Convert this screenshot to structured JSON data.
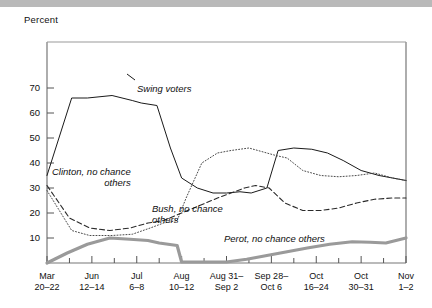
{
  "figure": {
    "top_rule": true,
    "y_axis_title": "Percent"
  },
  "chart_data": {
    "type": "line",
    "title": "",
    "subtitle": "",
    "xlabel": "",
    "ylabel": "Percent",
    "ylim": [
      0,
      78
    ],
    "yticks": [
      10,
      20,
      30,
      40,
      50,
      60,
      70
    ],
    "grid": false,
    "legend": "inline-annotations",
    "x": [
      "Mar 20–22",
      "Jun 12–14",
      "Jul 6–8",
      "Aug 10–12",
      "Aug 31–Sep 2",
      "Sep 28–Oct 6",
      "Oct 16–24",
      "Oct 30–31",
      "Nov 1–2"
    ],
    "x_tick_labels": [
      {
        "line1": "Mar",
        "line2": "20–22"
      },
      {
        "line1": "Jun",
        "line2": "12–14"
      },
      {
        "line1": "Jul",
        "line2": "6–8"
      },
      {
        "line1": "Aug",
        "line2": "10–12"
      },
      {
        "line1": "Aug 31–",
        "line2": "Sep 2"
      },
      {
        "line1": "Sep 28–",
        "line2": "Oct 6"
      },
      {
        "line1": "Oct",
        "line2": "16–24"
      },
      {
        "line1": "Oct",
        "line2": "30–31"
      },
      {
        "line1": "Nov",
        "line2": "1–2"
      }
    ],
    "series": [
      {
        "name": "Swing voters",
        "style": "solid",
        "color": "#1a1a1a",
        "width": 1,
        "label_text": "Swing voters",
        "x": [
          0,
          0.55,
          0.9,
          1.45,
          1.9,
          2.1,
          2.45,
          2.75,
          3.0,
          3.35,
          3.7,
          4.0,
          4.3,
          4.55,
          4.9,
          5.15,
          5.5,
          5.9,
          6.25,
          6.6,
          7.0,
          7.4,
          8.0
        ],
        "values": [
          35,
          66,
          66,
          67,
          65,
          64,
          63,
          46,
          34,
          30,
          28,
          28,
          28.5,
          28,
          30,
          45,
          46,
          45.5,
          44,
          41,
          37,
          35,
          33
        ]
      },
      {
        "name": "Clinton, no chance others",
        "style": "dotted",
        "color": "#4a4a4a",
        "width": 1,
        "label_text": "Clinton, no chance\nothers",
        "x": [
          0,
          0.55,
          0.95,
          1.45,
          1.9,
          2.3,
          2.6,
          2.9,
          3.1,
          3.45,
          3.8,
          4.1,
          4.5,
          4.9,
          5.1,
          5.35,
          5.7,
          6.1,
          6.5,
          6.9,
          7.3,
          7.7,
          8.0
        ],
        "values": [
          29,
          13,
          11,
          11,
          11.5,
          14,
          16,
          17,
          26,
          40,
          44,
          45,
          46,
          44,
          43,
          42,
          37,
          35,
          34.5,
          35,
          36,
          34,
          33
        ]
      },
      {
        "name": "Bush, no chance others",
        "style": "dashed",
        "color": "#2a2a2a",
        "width": 1.1,
        "label_text": "Bush, no chance\nothers",
        "x": [
          0,
          0.5,
          0.95,
          1.4,
          1.85,
          2.25,
          2.6,
          3.0,
          3.4,
          3.8,
          4.1,
          4.4,
          4.65,
          4.95,
          5.3,
          5.7,
          6.1,
          6.5,
          6.9,
          7.3,
          7.7,
          8.0
        ],
        "values": [
          31,
          18,
          14,
          13,
          14,
          16,
          17,
          20,
          23,
          26,
          28,
          30,
          31,
          30,
          24,
          21,
          21,
          22,
          24,
          25.5,
          26,
          26
        ]
      },
      {
        "name": "Perot, no chance others",
        "style": "solid",
        "color": "#9a9a9a",
        "width": 3.2,
        "label_text": "Perot, no chance others",
        "x": [
          0,
          0.45,
          0.9,
          1.4,
          1.85,
          2.25,
          2.5,
          2.9,
          3.0,
          3.6,
          4.0,
          4.45,
          4.9,
          5.35,
          5.8,
          6.3,
          6.8,
          7.2,
          7.55,
          8.0
        ],
        "values": [
          0,
          4,
          7.5,
          10,
          9.5,
          9,
          8,
          7,
          0.4,
          0.4,
          0.4,
          1.5,
          3,
          4.5,
          6,
          7.5,
          8.5,
          8.3,
          8,
          10
        ]
      }
    ],
    "annotations": [
      {
        "text": "Swing voters",
        "x_px": 137,
        "y_px": 83
      },
      {
        "text": "Clinton, no chance others",
        "x_px": 52,
        "y_px": 166
      },
      {
        "text": "Bush, no chance others",
        "x_px": 152,
        "y_px": 203
      },
      {
        "text": "Perot, no chance others",
        "x_px": 224,
        "y_px": 233
      }
    ]
  }
}
